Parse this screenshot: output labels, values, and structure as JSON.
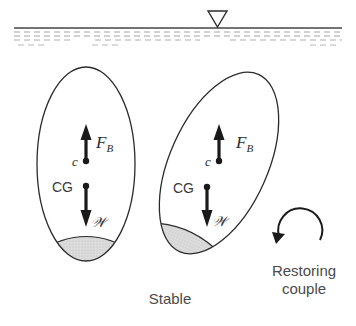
{
  "diagram": {
    "title": "Stable",
    "free_surface_symbol": "▽",
    "bodies": [
      {
        "name": "upright-body",
        "buoyancy_label": "F",
        "buoyancy_subscript": "B",
        "centroid_label": "c",
        "cg_label": "CG",
        "weight_label": "𝒲"
      },
      {
        "name": "tilted-body",
        "buoyancy_label": "F",
        "buoyancy_subscript": "B",
        "centroid_label": "c",
        "cg_label": "CG",
        "weight_label": "𝒲"
      }
    ],
    "couple": {
      "line1": "Restoring",
      "line2": "couple"
    }
  },
  "colors": {
    "stroke": "#2b2b2b",
    "ballast_fill": "#d8d8d8",
    "water_dash": "#9a9a9a",
    "text": "#4a4a4a"
  }
}
